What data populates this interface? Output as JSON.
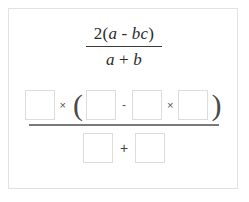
{
  "card": {
    "name": "math-exercise-card"
  },
  "given_expression": {
    "numerator": "2(a - bc)",
    "numerator_parts": {
      "coefficient": "2",
      "open_paren": "(",
      "var_a": "a",
      "minus": "-",
      "var_bc": "bc",
      "close_paren": ")"
    },
    "denominator": "a + b",
    "denominator_parts": {
      "var_a": "a",
      "plus": "+",
      "var_b": "b"
    }
  },
  "answer": {
    "numerator": {
      "box1_value": "",
      "box1_placeholder": "",
      "times1": "×",
      "open_paren": "(",
      "box2_value": "",
      "box2_placeholder": "",
      "minus": "-",
      "box3_value": "",
      "box3_placeholder": "",
      "times2": "×",
      "box4_value": "",
      "box4_placeholder": "",
      "close_paren": ")"
    },
    "denominator": {
      "box5_value": "",
      "box5_placeholder": "",
      "plus": "+",
      "box6_value": "",
      "box6_placeholder": ""
    }
  },
  "colors": {
    "card_border": "#e2e2e2",
    "box_border": "#dcdcdc",
    "text": "#2b2b2b",
    "fraction_bar": "#7a7a7a",
    "background": "#ffffff"
  }
}
